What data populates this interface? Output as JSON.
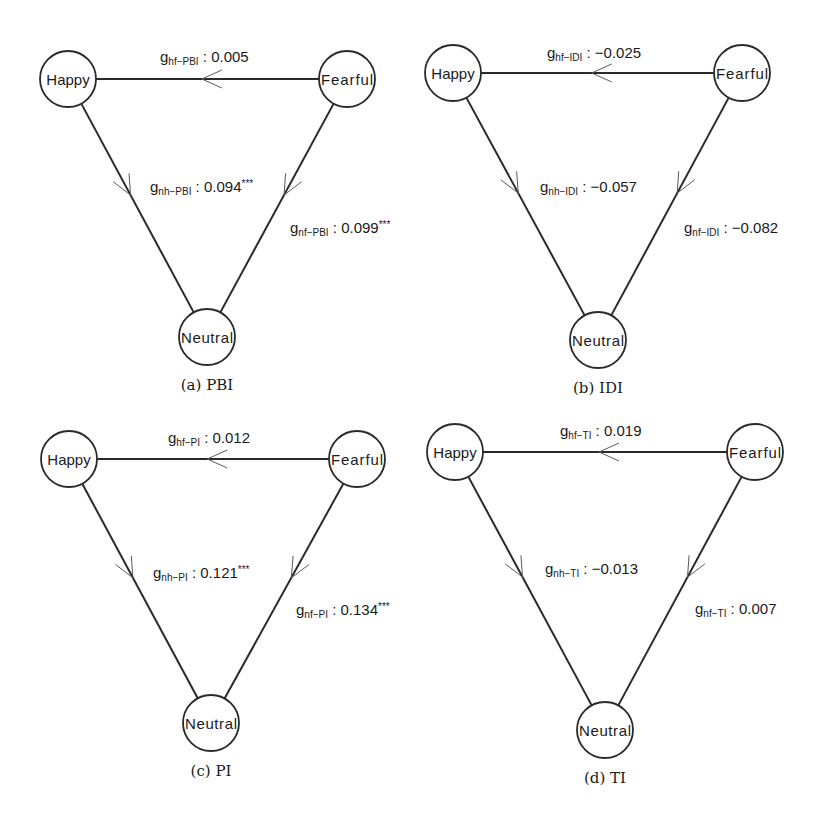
{
  "figure": {
    "node_names": {
      "happy": "Happy",
      "fearful": "Fearful",
      "neutral": "Neutral"
    },
    "panels": [
      {
        "id": "a",
        "caption": "(a) PBI",
        "edges": [
          {
            "key": "hf",
            "from": "fearful",
            "to": "happy",
            "symbol": "g",
            "subscript": "hf−PBI",
            "value": "0.005",
            "significance": ""
          },
          {
            "key": "nh",
            "from": "happy",
            "to": "neutral",
            "symbol": "g",
            "subscript": "nh−PBI",
            "value": "0.094",
            "significance": "***"
          },
          {
            "key": "nf",
            "from": "fearful",
            "to": "neutral",
            "symbol": "g",
            "subscript": "nf−PBI",
            "value": "0.099",
            "significance": "***"
          }
        ]
      },
      {
        "id": "b",
        "caption": "(b) IDI",
        "edges": [
          {
            "key": "hf",
            "from": "fearful",
            "to": "happy",
            "symbol": "g",
            "subscript": "hf−IDI",
            "value": "−0.025",
            "significance": ""
          },
          {
            "key": "nh",
            "from": "happy",
            "to": "neutral",
            "symbol": "g",
            "subscript": "nh−IDI",
            "value": "−0.057",
            "significance": ""
          },
          {
            "key": "nf",
            "from": "fearful",
            "to": "neutral",
            "symbol": "g",
            "subscript": "nf−IDI",
            "value": "−0.082",
            "significance": ""
          }
        ]
      },
      {
        "id": "c",
        "caption": "(c) PI",
        "edges": [
          {
            "key": "hf",
            "from": "fearful",
            "to": "happy",
            "symbol": "g",
            "subscript": "hf−PI",
            "value": "0.012",
            "significance": ""
          },
          {
            "key": "nh",
            "from": "happy",
            "to": "neutral",
            "symbol": "g",
            "subscript": "nh−PI",
            "value": "0.121",
            "significance": "***"
          },
          {
            "key": "nf",
            "from": "fearful",
            "to": "neutral",
            "symbol": "g",
            "subscript": "nf−PI",
            "value": "0.134",
            "significance": "***"
          }
        ]
      },
      {
        "id": "d",
        "caption": "(d) TI",
        "edges": [
          {
            "key": "hf",
            "from": "fearful",
            "to": "happy",
            "symbol": "g",
            "subscript": "hf−TI",
            "value": "0.019",
            "significance": ""
          },
          {
            "key": "nh",
            "from": "happy",
            "to": "neutral",
            "symbol": "g",
            "subscript": "nh−TI",
            "value": "−0.013",
            "significance": ""
          },
          {
            "key": "nf",
            "from": "fearful",
            "to": "neutral",
            "symbol": "g",
            "subscript": "nf−TI",
            "value": "0.007",
            "significance": ""
          }
        ]
      }
    ]
  }
}
